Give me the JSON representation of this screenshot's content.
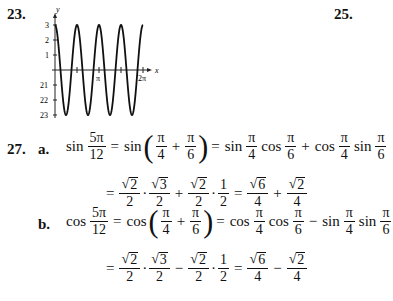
{
  "problems": [
    {
      "number": "23."
    },
    {
      "number": "25."
    },
    {
      "number": "27."
    }
  ],
  "graph": {
    "y_label": "y",
    "x_label": "x",
    "y_ticks": [
      "3",
      "2",
      "1",
      "21",
      "22",
      "23"
    ],
    "x_ticks": [
      "π",
      "2π"
    ]
  },
  "chart_data": {
    "type": "line",
    "title": "",
    "xlabel": "x",
    "ylabel": "y",
    "function": "y = 3cos(4x)",
    "xlim": [
      0,
      6.283
    ],
    "ylim": [
      -3,
      3
    ],
    "x_tick_labels": [
      "π",
      "2π"
    ],
    "y_tick_labels": [
      "3",
      "2",
      "1",
      "21",
      "22",
      "23"
    ],
    "series": [
      {
        "name": "y",
        "x": [
          0,
          0.3927,
          0.7854,
          1.1781,
          1.5708,
          1.9635,
          2.3562,
          2.7489,
          3.1416,
          3.5343,
          3.927,
          4.3197,
          4.7124,
          5.1051,
          5.4978,
          5.8905,
          6.2832
        ],
        "values": [
          3,
          0,
          -3,
          0,
          3,
          0,
          -3,
          0,
          3,
          0,
          -3,
          0,
          3,
          0,
          -3,
          0,
          3
        ]
      }
    ],
    "grid": false
  },
  "p27": {
    "a": {
      "label": "a.",
      "line1": {
        "fn1": "sin",
        "f1n": "5π",
        "f1d": "12",
        "eq1": "=",
        "fn2": "sin",
        "f2n": "π",
        "f2d": "4",
        "plus": "+",
        "f3n": "π",
        "f3d": "6",
        "eq2": "=",
        "fn3": "sin",
        "f4n": "π",
        "f4d": "4",
        "fn4": "cos",
        "f5n": "π",
        "f5d": "6",
        "op": "+",
        "fn5": "cos",
        "f6n": "π",
        "f6d": "4",
        "fn6": "sin",
        "f7n": "π",
        "f7d": "6"
      },
      "line2": {
        "eq": "=",
        "r1": "2",
        "d1": "2",
        "dot1": "·",
        "r2": "3",
        "d2": "2",
        "op1": "+",
        "r3": "2",
        "d3": "2",
        "dot2": "·",
        "n4": "1",
        "d4": "2",
        "eq2": "=",
        "r5": "6",
        "d5": "4",
        "op2": "+",
        "r6": "2",
        "d6": "4"
      }
    },
    "b": {
      "label": "b.",
      "line1": {
        "fn1": "cos",
        "f1n": "5π",
        "f1d": "12",
        "eq1": "=",
        "fn2": "cos",
        "f2n": "π",
        "f2d": "4",
        "plus": "+",
        "f3n": "π",
        "f3d": "6",
        "eq2": "=",
        "fn3": "cos",
        "f4n": "π",
        "f4d": "4",
        "fn4": "cos",
        "f5n": "π",
        "f5d": "6",
        "op": "−",
        "fn5": "sin",
        "f6n": "π",
        "f6d": "4",
        "fn6": "sin",
        "f7n": "π",
        "f7d": "6"
      },
      "line2": {
        "eq": "=",
        "r1": "2",
        "d1": "2",
        "dot1": "·",
        "r2": "3",
        "d2": "2",
        "op1": "−",
        "r3": "2",
        "d3": "2",
        "dot2": "·",
        "n4": "1",
        "d4": "2",
        "eq2": "=",
        "r5": "6",
        "d5": "4",
        "op2": "−",
        "r6": "2",
        "d6": "4"
      }
    },
    "radical": "√"
  }
}
